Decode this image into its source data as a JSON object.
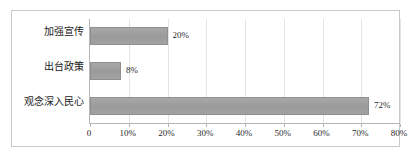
{
  "chart_data": {
    "type": "bar",
    "orientation": "horizontal",
    "title": "",
    "subtitle": "",
    "xlabel": "",
    "ylabel": "",
    "categories": [
      "加强宣传",
      "出台政策",
      "观念深入民心"
    ],
    "values": [
      20,
      8,
      72
    ],
    "data_labels": [
      "20%",
      "8%",
      "72%"
    ],
    "xlim": [
      0,
      80
    ],
    "x_ticks": [
      0,
      10,
      20,
      30,
      40,
      50,
      60,
      70,
      80
    ],
    "x_tick_labels": [
      "0",
      "10%",
      "20%",
      "30%",
      "40%",
      "50%",
      "60%",
      "70%",
      "80%"
    ],
    "grid": true,
    "legend": false,
    "legend_position": "none",
    "series": [
      {
        "name": "",
        "values": [
          20,
          8,
          72
        ]
      }
    ],
    "colors": {
      "bar_fill": "#9e9e9e",
      "bar_border": "#8f8f8f",
      "gridline": "#e4e4e4",
      "axis": "#b6b6b6",
      "frame_border": "#c9c9c9",
      "text": "#1b1b1b",
      "background": "#ffffff"
    }
  }
}
